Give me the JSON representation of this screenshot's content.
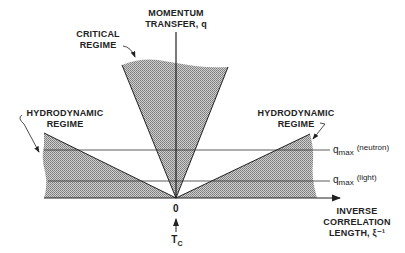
{
  "diagram": {
    "vertical_axis": {
      "line1": "MOMENTUM",
      "line2": "TRANSFER, q"
    },
    "horizontal_axis": {
      "line1": "INVERSE",
      "line2": "CORRELATION",
      "line3": "LENGTH, ξ⁻¹"
    },
    "origin_label": "0",
    "critical_temp_label": "T",
    "critical_temp_sub": "C",
    "regions": {
      "critical": {
        "line1": "CRITICAL",
        "line2": "REGIME"
      },
      "hydro_left": {
        "line1": "HYDRODYNAMIC",
        "line2": "REGIME"
      },
      "hydro_right": {
        "line1": "HYDRODYNAMIC",
        "line2": "REGIME"
      }
    },
    "qmax_neutron": {
      "q": "q",
      "sub": "max",
      "paren": "(neutron)"
    },
    "qmax_light": {
      "q": "q",
      "sub": "max",
      "paren": "(light)"
    },
    "colors": {
      "ink": "#222222",
      "shade": "#a8a8a8",
      "background": "#ffffff"
    }
  }
}
